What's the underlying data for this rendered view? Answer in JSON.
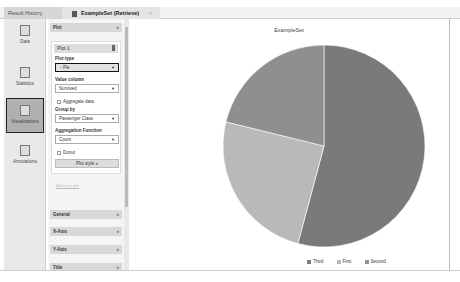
{
  "tabs": [
    {
      "label": "Result History"
    },
    {
      "label": "ExampleSet (Retrieve)",
      "close": "×"
    }
  ],
  "nav": [
    {
      "label": "Data"
    },
    {
      "label": "Statistics"
    },
    {
      "label": "Visualizations",
      "active": true
    },
    {
      "label": "Annotations"
    }
  ],
  "panel": {
    "plot_section": "Plot",
    "collapse": "«",
    "plot_name": "Plot 1",
    "plot_type_label": "Plot type",
    "plot_type_value": "Pie",
    "value_column_label": "Value column",
    "value_column_value": "Survived",
    "aggregate_label": "Aggregate data",
    "group_by_label": "Group by",
    "group_by_value": "Passenger Class",
    "agg_fn_label": "Aggregation Function",
    "agg_fn_value": "Count",
    "donut_label": "Donut",
    "plot_style_label": "Plot style »",
    "add_plot": "Add new plot",
    "sections": [
      "General",
      "X-Axis",
      "Y-Axis",
      "Title"
    ],
    "expand": "»",
    "dropdown_arrow": "▼"
  },
  "chart_data": {
    "type": "pie",
    "title": "ExampleSet",
    "categories": [
      "Third",
      "First",
      "Second"
    ],
    "values": [
      709,
      323,
      277
    ],
    "colors": [
      "#7a7a7a",
      "#b9b9b9",
      "#8f8f8f"
    ],
    "legend": "bottom"
  }
}
